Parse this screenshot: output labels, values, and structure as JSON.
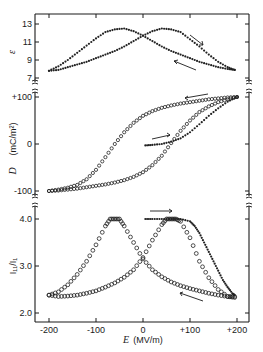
{
  "figure": {
    "x_axis": {
      "label_symbol": "E",
      "label_unit": "(MV/m)",
      "ticks": [
        "-200",
        "-100",
        "0",
        "+100",
        "+200"
      ],
      "tick_values": [
        -200,
        -100,
        0,
        100,
        200
      ],
      "range": [
        -215,
        225
      ]
    },
    "panels": [
      {
        "id": "epsilon",
        "ylabel": "ε",
        "ticks": [
          "13",
          "11",
          "9",
          "7"
        ],
        "tick_values": [
          13,
          11,
          9,
          7
        ]
      },
      {
        "id": "displacement",
        "ylabel_symbol": "D",
        "ylabel_unit": "(mC/m²)",
        "ticks": [
          "+100",
          "0",
          "-100"
        ],
        "tick_values": [
          100,
          0,
          -100
        ]
      },
      {
        "id": "intensity-ratio",
        "ylabel": "I₁₁/I₁",
        "ticks": [
          "4.0",
          "3.0",
          "2.0"
        ],
        "tick_values": [
          4.0,
          3.0,
          2.0
        ]
      }
    ]
  },
  "chart_data": [
    {
      "type": "scatter",
      "title": "",
      "xlabel": "E (MV/m)",
      "ylabel": "ε",
      "ylim": [
        6.5,
        14.2
      ],
      "xlim": [
        -215,
        225
      ],
      "grid": false,
      "legend": null,
      "annotations": [
        "arrow → on upper right branch (increasing E)",
        "arrow ← on lower right branch (decreasing E)"
      ],
      "series": [
        {
          "name": "increasing E (filled dots)",
          "marker": "filled",
          "x": [
            -200,
            -180,
            -160,
            -140,
            -120,
            -100,
            -80,
            -60,
            -40,
            -20,
            0,
            20,
            40,
            60,
            80,
            100,
            120,
            140,
            160,
            180,
            195
          ],
          "y": [
            7.8,
            7.9,
            8.2,
            8.5,
            8.8,
            9.2,
            9.6,
            10.0,
            10.5,
            11.1,
            11.7,
            12.2,
            12.5,
            12.4,
            12.1,
            11.3,
            10.5,
            9.6,
            8.8,
            8.2,
            7.9
          ]
        },
        {
          "name": "decreasing E (filled dots)",
          "marker": "filled",
          "x": [
            195,
            180,
            160,
            140,
            120,
            100,
            80,
            60,
            40,
            20,
            0,
            -20,
            -40,
            -60,
            -80,
            -100,
            -120,
            -140,
            -160,
            -180,
            -200
          ],
          "y": [
            7.9,
            8.0,
            8.2,
            8.5,
            8.8,
            9.2,
            9.6,
            10.0,
            10.5,
            11.1,
            11.7,
            12.2,
            12.5,
            12.4,
            12.1,
            11.4,
            10.6,
            9.8,
            9.0,
            8.3,
            7.8
          ]
        }
      ]
    },
    {
      "type": "scatter",
      "title": "",
      "xlabel": "E (MV/m)",
      "ylabel": "D (mC/m²)",
      "ylim": [
        -110,
        110
      ],
      "xlim": [
        -215,
        225
      ],
      "grid": false,
      "legend": null,
      "annotations": [
        "arrow ← on upper branch near +100",
        "arrow → on virgin curve near D=0"
      ],
      "series": [
        {
          "name": "hysteresis loop upper branch (open circles, decreasing E)",
          "marker": "open",
          "x": [
            200,
            180,
            160,
            140,
            120,
            100,
            80,
            60,
            40,
            20,
            0,
            -20,
            -40,
            -60,
            -80,
            -100,
            -120,
            -140,
            -160,
            -180,
            -200
          ],
          "y": [
            100,
            99,
            97,
            95,
            92,
            89,
            86,
            82,
            77,
            70,
            60,
            45,
            25,
            0,
            -28,
            -55,
            -75,
            -87,
            -93,
            -97,
            -100
          ]
        },
        {
          "name": "hysteresis loop lower branch (open circles, increasing E)",
          "marker": "open",
          "x": [
            -200,
            -180,
            -160,
            -140,
            -120,
            -100,
            -80,
            -60,
            -40,
            -20,
            0,
            20,
            40,
            60,
            80,
            100,
            120,
            140,
            160,
            180,
            200
          ],
          "y": [
            -100,
            -99,
            -97,
            -95,
            -92,
            -89,
            -86,
            -82,
            -77,
            -70,
            -60,
            -45,
            -25,
            2,
            28,
            50,
            68,
            80,
            89,
            95,
            100
          ]
        },
        {
          "name": "virgin curve (filled dots)",
          "marker": "filled",
          "x": [
            5,
            20,
            40,
            60,
            80,
            100,
            120,
            140,
            160,
            180,
            200
          ],
          "y": [
            -3,
            -2,
            0,
            5,
            12,
            25,
            42,
            60,
            76,
            90,
            100
          ]
        }
      ]
    },
    {
      "type": "scatter",
      "title": "",
      "xlabel": "E (MV/m)",
      "ylabel": "I₁₁/I₁",
      "ylim": [
        1.8,
        4.2
      ],
      "xlim": [
        -215,
        225
      ],
      "grid": false,
      "legend": null,
      "annotations": [
        "arrow → above virgin curve near 4.0",
        "arrow ← on lower right branch"
      ],
      "series": [
        {
          "name": "decreasing E (open circles)",
          "marker": "open",
          "x": [
            195,
            180,
            160,
            140,
            120,
            100,
            80,
            60,
            40,
            20,
            0,
            -20,
            -40,
            -50,
            -60,
            -70,
            -80,
            -100,
            -120,
            -140,
            -160,
            -180,
            -200
          ],
          "y": [
            2.35,
            2.35,
            2.38,
            2.42,
            2.47,
            2.52,
            2.58,
            2.66,
            2.77,
            2.92,
            3.15,
            3.5,
            3.85,
            4.0,
            4.0,
            4.0,
            3.85,
            3.45,
            3.1,
            2.82,
            2.6,
            2.45,
            2.38
          ]
        },
        {
          "name": "increasing E (open circles)",
          "marker": "open",
          "x": [
            -200,
            -180,
            -160,
            -140,
            -120,
            -100,
            -80,
            -60,
            -40,
            -20,
            0,
            20,
            40,
            50,
            60,
            70,
            80,
            100,
            120,
            140,
            160,
            180,
            195
          ],
          "y": [
            2.38,
            2.35,
            2.36,
            2.38,
            2.42,
            2.47,
            2.55,
            2.64,
            2.76,
            2.92,
            3.18,
            3.55,
            3.88,
            4.0,
            4.0,
            4.0,
            3.95,
            3.6,
            3.1,
            2.75,
            2.5,
            2.35,
            2.33
          ]
        },
        {
          "name": "virgin curve (filled dots)",
          "marker": "filled",
          "x": [
            5,
            20,
            40,
            60,
            80,
            100,
            110,
            120,
            130,
            140,
            150,
            160,
            170,
            180,
            190,
            195
          ],
          "y": [
            4.0,
            4.0,
            4.0,
            4.0,
            4.0,
            3.95,
            3.85,
            3.7,
            3.5,
            3.3,
            3.1,
            2.9,
            2.7,
            2.55,
            2.42,
            2.38
          ]
        }
      ]
    }
  ]
}
